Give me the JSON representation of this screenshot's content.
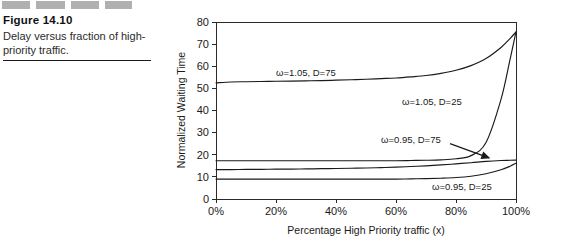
{
  "figure": {
    "number_label": "Figure 14.10",
    "caption": "Delay versus fraction of high-priority traffic.",
    "redacted_blocks": [
      "block-1",
      "block-2",
      "block-3",
      "block-4"
    ]
  },
  "chart_data": {
    "type": "line",
    "title": "",
    "xlabel": "Percentage High Priority traffic (x)",
    "ylabel": "Normalized Waiting Time",
    "xlim": [
      0,
      100
    ],
    "ylim": [
      0,
      80
    ],
    "grid": false,
    "legend_position": "inline-annotations",
    "xtick_labels": [
      "0%",
      "20%",
      "40%",
      "60%",
      "80%",
      "100%"
    ],
    "xtick_values": [
      0,
      20,
      40,
      60,
      80,
      100
    ],
    "ytick_labels": [
      "0",
      "10",
      "20",
      "30",
      "40",
      "50",
      "60",
      "70",
      "80"
    ],
    "ytick_values": [
      0,
      10,
      20,
      30,
      40,
      50,
      60,
      70,
      80
    ],
    "x": [
      0,
      5,
      10,
      15,
      20,
      25,
      30,
      35,
      40,
      45,
      50,
      55,
      60,
      65,
      70,
      75,
      80,
      85,
      90,
      95,
      98,
      100
    ],
    "series": [
      {
        "name": "w=1.05, D=75",
        "label": "ω=1.05, D=75",
        "values": [
          52.5,
          52.9,
          53.0,
          53.1,
          53.2,
          53.3,
          53.4,
          53.5,
          53.7,
          53.9,
          54.1,
          54.4,
          54.7,
          55.2,
          55.8,
          56.8,
          58.2,
          60.3,
          63.5,
          68.5,
          72.5,
          75.5
        ],
        "label_x": 20,
        "label_y": 57
      },
      {
        "name": "w=1.05, D=25",
        "label": "ω=1.05, D=25",
        "values": [
          17.3,
          17.3,
          17.3,
          17.3,
          17.3,
          17.3,
          17.3,
          17.3,
          17.3,
          17.3,
          17.3,
          17.3,
          17.3,
          17.4,
          17.5,
          17.7,
          18.2,
          19.6,
          25.5,
          45.0,
          63.0,
          75.5
        ],
        "label_x": 62,
        "label_y": 44
      },
      {
        "name": "w=0.95, D=75",
        "label": "ω=0.95, D=75",
        "values": [
          13.3,
          13.3,
          13.4,
          13.4,
          13.5,
          13.5,
          13.6,
          13.7,
          13.8,
          13.9,
          14.0,
          14.2,
          14.4,
          14.7,
          15.0,
          15.4,
          15.9,
          16.4,
          17.0,
          17.4,
          17.5,
          17.6
        ],
        "label_x": 55,
        "label_y": 27
      },
      {
        "name": "w=0.95, D=25",
        "label": "ω=0.95, D=25",
        "values": [
          9.0,
          9.0,
          9.0,
          9.0,
          9.0,
          9.0,
          9.0,
          9.0,
          9.0,
          9.0,
          9.0,
          9.0,
          9.0,
          9.1,
          9.2,
          9.4,
          9.7,
          10.3,
          11.4,
          13.2,
          14.8,
          16.2
        ],
        "label_x": 72,
        "label_y": 5.5
      }
    ],
    "annotations": [
      {
        "name": "pointer-to-w095-d75",
        "from_x": 78,
        "from_y": 25,
        "to_x": 91,
        "to_y": 18.6
      }
    ]
  }
}
